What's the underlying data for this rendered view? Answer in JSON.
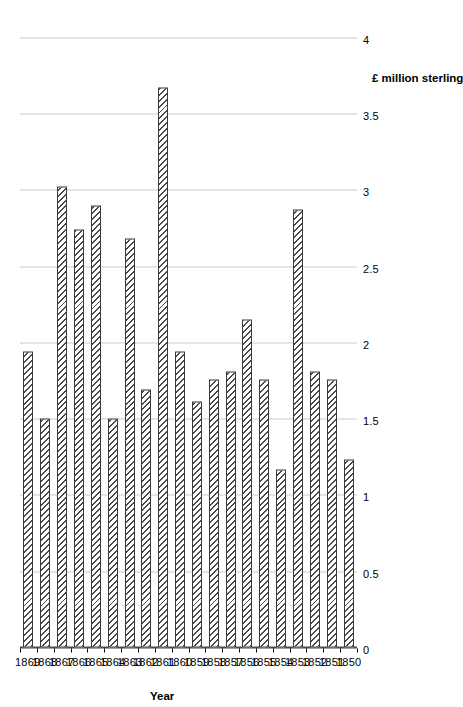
{
  "chart_data": {
    "type": "bar",
    "title": "",
    "orientation": "vertical-rotated",
    "xlabel": "Year",
    "ylabel": "£ million sterling",
    "ylim": [
      0,
      4
    ],
    "ytick_values": [
      0,
      0.5,
      1,
      1.5,
      2,
      2.5,
      3,
      3.5,
      4
    ],
    "ytick_labels": [
      "0",
      "0.5",
      "1",
      "1.5",
      "2",
      "2.5",
      "3",
      "3.5",
      "4"
    ],
    "grid": true,
    "legend": false,
    "categories": [
      "1869",
      "1868",
      "1867",
      "1866",
      "1865",
      "1864",
      "1863",
      "1862",
      "1861",
      "1860",
      "1859",
      "1858",
      "1857",
      "1856",
      "1855",
      "1854",
      "1853",
      "1852",
      "1851",
      "1850"
    ],
    "values": [
      1.94,
      1.5,
      3.02,
      2.74,
      2.9,
      1.5,
      2.68,
      1.69,
      3.67,
      1.94,
      1.61,
      1.76,
      1.81,
      2.15,
      1.76,
      1.17,
      2.87,
      1.81,
      1.76,
      1.23
    ],
    "bar_fill": "hatched-diagonal",
    "bar_edge_color": "#3a3a3a",
    "bar_face_color": "#ffffff",
    "grid_color": "#c9c9c9",
    "axis_color": "#4a4a4a"
  }
}
